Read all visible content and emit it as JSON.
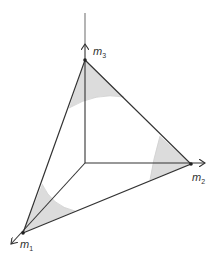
{
  "diagram": {
    "type": "simplex-in-3d-axes",
    "colors": {
      "line": "#333333",
      "shade": "#dcdcdc",
      "background": "#ffffff"
    },
    "axes": [
      {
        "name": "m1",
        "label_base": "m",
        "label_sub": "1",
        "direction": "down-left"
      },
      {
        "name": "m2",
        "label_base": "m",
        "label_sub": "2",
        "direction": "right"
      },
      {
        "name": "m3",
        "label_base": "m",
        "label_sub": "3",
        "direction": "up"
      }
    ],
    "vertices": [
      "m1",
      "m2",
      "m3"
    ],
    "shaded_regions": 3,
    "inscribed_curve": "circle"
  }
}
